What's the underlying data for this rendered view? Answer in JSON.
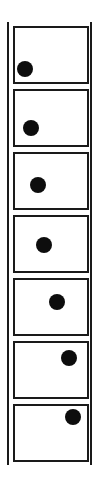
{
  "diagram": {
    "colors": {
      "line": "#1a1a1a",
      "ball": "#0d0d0d",
      "background": "#ffffff"
    },
    "frames": [
      {
        "index": 1,
        "top": 26,
        "ball": {
          "x": 25,
          "y": 69
        }
      },
      {
        "index": 2,
        "top": 89,
        "ball": {
          "x": 31,
          "y": 128
        }
      },
      {
        "index": 3,
        "top": 152,
        "ball": {
          "x": 38,
          "y": 185
        }
      },
      {
        "index": 4,
        "top": 215,
        "ball": {
          "x": 44,
          "y": 245
        }
      },
      {
        "index": 5,
        "top": 278,
        "ball": {
          "x": 57,
          "y": 302
        }
      },
      {
        "index": 6,
        "top": 341,
        "ball": {
          "x": 69,
          "y": 358
        }
      },
      {
        "index": 7,
        "top": 404,
        "ball": {
          "x": 73,
          "y": 417
        }
      }
    ]
  }
}
